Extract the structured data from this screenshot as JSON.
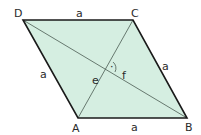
{
  "diagram": {
    "type": "rhombus",
    "colors": {
      "fill": "#d5eee1",
      "edge": "#1a1a1a",
      "diagonal": "#4a5a52",
      "text": "#2a2a2a"
    },
    "vertices": {
      "A": {
        "label": "A",
        "x": 78,
        "y": 118
      },
      "B": {
        "label": "B",
        "x": 187,
        "y": 118
      },
      "C": {
        "label": "C",
        "x": 133,
        "y": 20
      },
      "D": {
        "label": "D",
        "x": 23,
        "y": 20
      }
    },
    "sides": {
      "top": "a",
      "right": "a",
      "bottom": "a",
      "left": "a"
    },
    "diagonals": {
      "e": "e",
      "f": "f"
    },
    "right_angle_marker": "·"
  }
}
